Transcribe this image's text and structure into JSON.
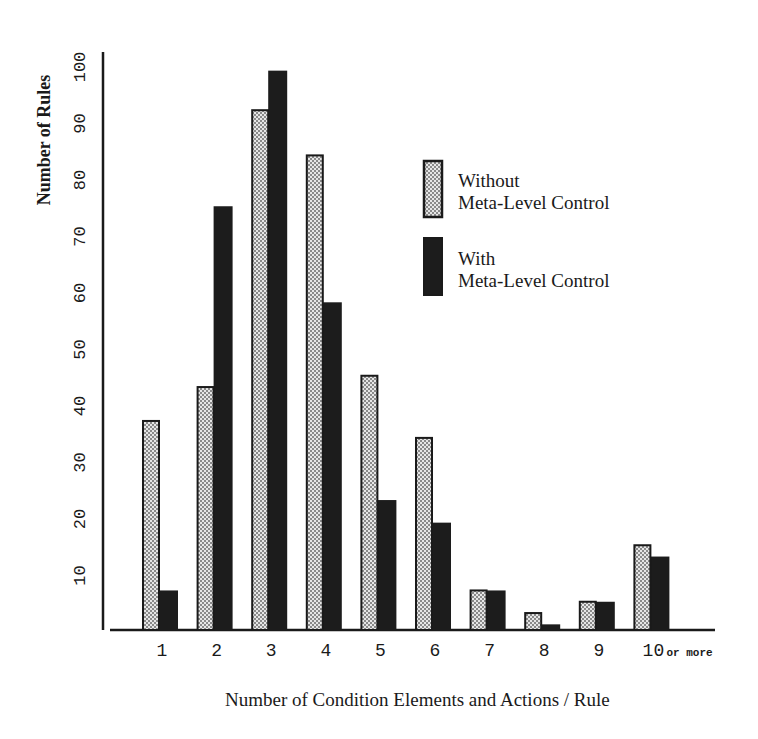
{
  "chart_data": {
    "type": "bar",
    "title": "",
    "xlabel": "Number of Condition Elements and Actions / Rule",
    "ylabel": "Number of Rules",
    "categories": [
      "1",
      "2",
      "3",
      "4",
      "5",
      "6",
      "7",
      "8",
      "9",
      "10"
    ],
    "category_suffix": {
      "10": "or more"
    },
    "series": [
      {
        "name": "Without Meta-Level Control",
        "fill": "stippled-gray",
        "values": [
          37,
          43,
          92,
          84,
          45,
          34,
          7,
          3,
          5,
          15
        ]
      },
      {
        "name": "With Meta-Level Control",
        "fill": "black",
        "values": [
          7,
          75,
          99,
          58,
          23,
          19,
          7,
          1,
          5,
          13
        ]
      }
    ],
    "yticks": [
      10,
      20,
      30,
      40,
      50,
      60,
      70,
      80,
      90,
      100
    ],
    "ylim": [
      0,
      100
    ],
    "grid": false,
    "legend_position": "upper-right inside plot",
    "colors": {
      "without": "#c8c8c8",
      "with": "#1c1c1c",
      "axis": "#1a1a1a",
      "text": "#1a1a1a"
    }
  },
  "legend": {
    "items": [
      {
        "line1": "Without",
        "line2": "Meta-Level Control"
      },
      {
        "line1": "With",
        "line2": "Meta-Level Control"
      }
    ]
  },
  "axes": {
    "xlabel": "Number of Condition Elements and Actions / Rule",
    "ylabel": "Number of Rules",
    "last_category_suffix": "or more"
  }
}
